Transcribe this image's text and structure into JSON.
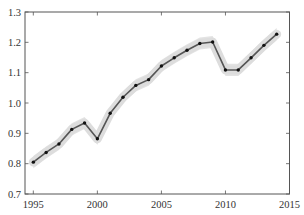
{
  "chart_data": {
    "type": "line",
    "title": "",
    "xlabel": "",
    "ylabel": "",
    "xlim": [
      1994.35,
      2015
    ],
    "ylim": [
      0.7,
      1.3
    ],
    "grid": false,
    "legend": null,
    "x_ticks": [
      1995,
      2000,
      2005,
      2010,
      2015
    ],
    "x_tick_labels": [
      "1995",
      "2000",
      "2005",
      "2010",
      "2015"
    ],
    "y_ticks": [
      0.7,
      0.8,
      0.9,
      1.0,
      1.1,
      1.2,
      1.3
    ],
    "y_tick_labels": [
      "0.7",
      "0.8",
      "0.9",
      "1.0",
      "1.1",
      "1.2",
      "1.3"
    ],
    "series": [
      {
        "name": "series",
        "marker": "circle",
        "line_color": "#555555",
        "marker_color": "#111111",
        "band_color": "#cccccc",
        "band_halfwidth": 0.02,
        "x": [
          1995,
          1996,
          1997,
          1998,
          1999,
          2000,
          2001,
          2002,
          2003,
          2004,
          2005,
          2006,
          2007,
          2008,
          2009,
          2010,
          2011,
          2012,
          2013,
          2014
        ],
        "values": [
          0.805,
          0.837,
          0.865,
          0.913,
          0.934,
          0.882,
          0.966,
          1.019,
          1.058,
          1.077,
          1.122,
          1.149,
          1.174,
          1.196,
          1.201,
          1.109,
          1.109,
          1.149,
          1.19,
          1.227
        ]
      }
    ]
  }
}
